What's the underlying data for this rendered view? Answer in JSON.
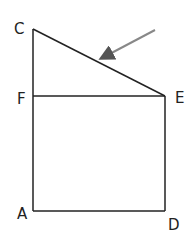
{
  "diagram": {
    "points": {
      "C": {
        "label": "C",
        "x": 33,
        "y": 29
      },
      "F": {
        "label": "F",
        "x": 33,
        "y": 96
      },
      "E": {
        "label": "E",
        "x": 165,
        "y": 96
      },
      "A": {
        "label": "A",
        "x": 33,
        "y": 211
      },
      "D": {
        "label": "D",
        "x": 165,
        "y": 211
      }
    },
    "segments": [
      "CA",
      "CE",
      "FE",
      "ED",
      "AD"
    ],
    "arrow": {
      "from": [
        155,
        30
      ],
      "to": [
        100,
        59
      ],
      "color": "#888888"
    },
    "line_color": "#222222"
  }
}
